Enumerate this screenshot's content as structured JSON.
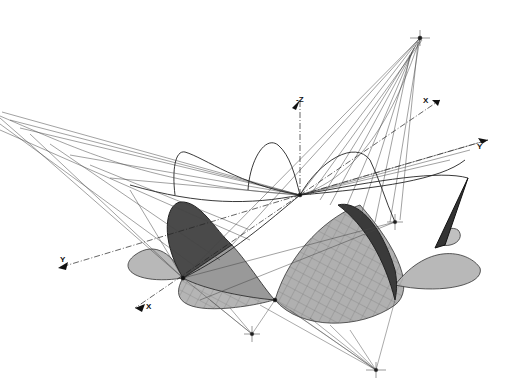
{
  "diagram": {
    "type": "technical-drawing",
    "colors": {
      "background": "#ffffff",
      "line": "#1a1a1a",
      "grid": "#555555",
      "shade_light": "#b5b5b5",
      "shade_mid": "#8a8a8a",
      "shade_dark": "#3a3a3a"
    },
    "axis_labels": [
      {
        "id": "neg-z",
        "text": "-Z",
        "x": 296,
        "y": 100
      },
      {
        "id": "x-top-right",
        "text": "X",
        "x": 425,
        "y": 100
      },
      {
        "id": "y-right",
        "text": "Y",
        "x": 478,
        "y": 145
      },
      {
        "id": "y-left",
        "text": "Y",
        "x": 60,
        "y": 260
      },
      {
        "id": "x-bottom-left",
        "text": "X",
        "x": 146,
        "y": 306
      }
    ]
  }
}
